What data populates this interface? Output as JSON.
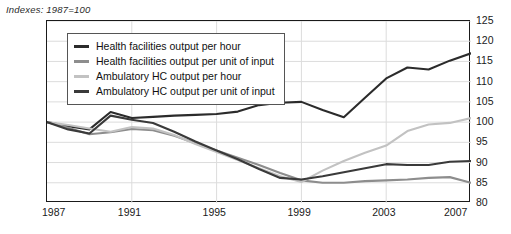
{
  "axis_note": "Indexes: 1987=100",
  "legend": {
    "items": [
      {
        "label": "Health facilities output per hour",
        "color": "#2b2b2b"
      },
      {
        "label": "Health facilities output per unit of input",
        "color": "#8d8d8d"
      },
      {
        "label": "Ambulatory HC output per hour",
        "color": "#c2c2c2"
      },
      {
        "label": "Ambulatory HC output per unit of input",
        "color": "#3a3a3a"
      }
    ]
  },
  "chart_data": {
    "type": "line",
    "title": "",
    "subtitle": "",
    "xlabel": "",
    "ylabel": "",
    "annotation": "Indexes: 1987=100",
    "grid": true,
    "legend_position": "top-left",
    "xlim": [
      1987,
      2007
    ],
    "ylim": [
      80,
      125
    ],
    "y_ticks": [
      80,
      85,
      90,
      95,
      100,
      105,
      110,
      115,
      120,
      125
    ],
    "x_ticks": [
      1987,
      1991,
      1995,
      1999,
      2003,
      2007
    ],
    "x": [
      1987,
      1988,
      1989,
      1990,
      1991,
      1992,
      1993,
      1994,
      1995,
      1996,
      1997,
      1998,
      1999,
      2000,
      2001,
      2002,
      2003,
      2004,
      2005,
      2006,
      2007
    ],
    "series": [
      {
        "name": "Health facilities output per hour",
        "color": "#2b2b2b",
        "values": [
          100.0,
          99.0,
          98.2,
          102.5,
          101.0,
          101.3,
          101.6,
          101.8,
          102.0,
          102.6,
          104.2,
          104.8,
          105.0,
          103.0,
          101.2,
          106.0,
          110.8,
          113.5,
          113.0,
          115.2,
          117.0
        ]
      },
      {
        "name": "Health facilities output per unit of input",
        "color": "#8d8d8d",
        "values": [
          100.0,
          98.6,
          97.0,
          97.5,
          98.3,
          98.0,
          96.6,
          94.8,
          93.0,
          91.2,
          89.4,
          87.4,
          85.6,
          85.0,
          85.0,
          85.4,
          85.6,
          85.8,
          86.2,
          86.4,
          85.0
        ]
      },
      {
        "name": "Ambulatory HC output per hour",
        "color": "#c2c2c2",
        "values": [
          100.0,
          99.3,
          98.4,
          97.6,
          98.8,
          98.4,
          96.8,
          94.6,
          92.6,
          90.6,
          88.6,
          86.6,
          85.2,
          88.0,
          90.4,
          92.4,
          94.2,
          97.8,
          99.4,
          99.8,
          101.0
        ]
      },
      {
        "name": "Ambulatory HC output per unit of input",
        "color": "#3a3a3a",
        "values": [
          100.0,
          98.2,
          97.2,
          101.6,
          100.6,
          99.8,
          97.6,
          95.2,
          93.0,
          90.8,
          88.4,
          86.2,
          85.8,
          86.6,
          87.6,
          88.6,
          89.6,
          89.4,
          89.4,
          90.2,
          90.4
        ]
      }
    ]
  }
}
